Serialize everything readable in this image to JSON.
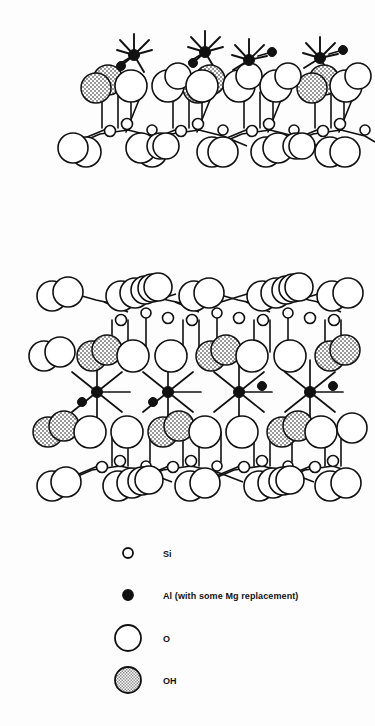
{
  "figure": {
    "title": "",
    "background_color": "#fdfdfd",
    "line_color": "#111111"
  },
  "structures": [
    {
      "id": "upper-layer-unit",
      "name": "upper-crystal-layer",
      "caption": "",
      "bounds": {
        "x": 68,
        "y": 30,
        "width": 300,
        "height": 140
      },
      "repeat_units": 4,
      "unit_spacing": 71,
      "unit_origin_x": 96,
      "layers": [
        {
          "name": "octahedral-sheet",
          "cation": "Al",
          "y": 48
        },
        {
          "name": "hydroxyl-row",
          "cation": "OH",
          "y": 80
        },
        {
          "name": "tetrahedral-sheet",
          "cation": "Si",
          "y": 124
        },
        {
          "name": "basal-oxygen-row",
          "cation": "O",
          "y": 146
        }
      ]
    },
    {
      "id": "lower-layer-unit",
      "name": "lower-crystal-layer",
      "caption": "",
      "bounds": {
        "x": 32,
        "y": 278,
        "width": 324,
        "height": 215
      },
      "repeat_units": 4,
      "unit_spacing": 71,
      "unit_origin_x": 96,
      "layers": [
        {
          "name": "upper-basal-oxygen-row",
          "cation": "O",
          "y": 296
        },
        {
          "name": "upper-tetrahedral-sheet",
          "cation": "Si",
          "y": 320
        },
        {
          "name": "upper-hydroxyl-row",
          "cation": "OH",
          "y": 356
        },
        {
          "name": "octahedral-sheet",
          "cation": "Al",
          "y": 392
        },
        {
          "name": "lower-hydroxyl-row",
          "cation": "OH",
          "y": 428
        },
        {
          "name": "lower-tetrahedral-sheet",
          "cation": "Si",
          "y": 462
        },
        {
          "name": "lower-basal-oxygen-row",
          "cation": "O",
          "y": 482
        }
      ]
    }
  ],
  "legend": {
    "name": "atom-key",
    "marker_x": 128,
    "label_x": 163,
    "items": [
      {
        "id": "si",
        "label": "Si",
        "marker": "small-open-circle",
        "radius": 5,
        "fill": "#ffffff",
        "stroke": "#111111",
        "y": 553
      },
      {
        "id": "al",
        "label": "Al (with some Mg replacement)",
        "marker": "small-filled-circle",
        "radius": 5,
        "fill": "#111111",
        "stroke": "#111111",
        "y": 595
      },
      {
        "id": "o",
        "label": "O",
        "marker": "large-open-circle",
        "radius": 13,
        "fill": "#ffffff",
        "stroke": "#111111",
        "y": 638
      },
      {
        "id": "oh",
        "label": "OH",
        "marker": "large-stippled-circle",
        "radius": 13,
        "fill": "stipple",
        "stroke": "#111111",
        "y": 680
      }
    ]
  }
}
